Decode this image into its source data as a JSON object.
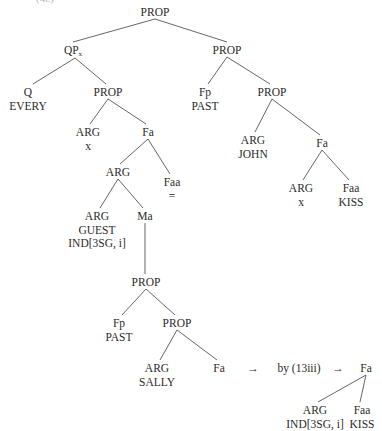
{
  "figure": {
    "top_fragment": "(4c)",
    "nodes": [
      {
        "id": "root",
        "lines": [
          "PROP"
        ],
        "x": 155,
        "y": 6
      },
      {
        "id": "qp",
        "lines": [
          "QP"
        ],
        "sub": "x",
        "x": 73,
        "y": 44
      },
      {
        "id": "prop_r",
        "lines": [
          "PROP"
        ],
        "x": 227,
        "y": 44
      },
      {
        "id": "q",
        "lines": [
          "Q",
          "EVERY"
        ],
        "x": 28,
        "y": 86
      },
      {
        "id": "prop_l",
        "lines": [
          "PROP"
        ],
        "x": 108,
        "y": 86
      },
      {
        "id": "fp_r",
        "lines": [
          "Fp",
          "PAST"
        ],
        "x": 205,
        "y": 86
      },
      {
        "id": "prop_r2",
        "lines": [
          "PROP"
        ],
        "x": 272,
        "y": 86
      },
      {
        "id": "arg_x",
        "lines": [
          "ARG",
          "x"
        ],
        "x": 88,
        "y": 126
      },
      {
        "id": "fa_l",
        "lines": [
          "Fa"
        ],
        "x": 148,
        "y": 126
      },
      {
        "id": "arg_john",
        "lines": [
          "ARG",
          "JOHN"
        ],
        "x": 253,
        "y": 134
      },
      {
        "id": "fa_r",
        "lines": [
          "Fa"
        ],
        "x": 322,
        "y": 137
      },
      {
        "id": "arg_mid",
        "lines": [
          "ARG"
        ],
        "x": 118,
        "y": 166
      },
      {
        "id": "faa_eq",
        "lines": [
          "Faa",
          "="
        ],
        "x": 172,
        "y": 176
      },
      {
        "id": "arg_x2",
        "lines": [
          "ARG",
          "x"
        ],
        "x": 301,
        "y": 182
      },
      {
        "id": "faa_kiss",
        "lines": [
          "Faa",
          "KISS"
        ],
        "x": 351,
        "y": 182
      },
      {
        "id": "arg_guest",
        "lines": [
          "ARG",
          "GUEST",
          "IND[3SG, i]"
        ],
        "x": 97,
        "y": 210
      },
      {
        "id": "ma",
        "lines": [
          "Ma"
        ],
        "x": 145,
        "y": 210
      },
      {
        "id": "prop_emb",
        "lines": [
          "PROP"
        ],
        "x": 146,
        "y": 276
      },
      {
        "id": "fp_emb",
        "lines": [
          "Fp",
          "PAST"
        ],
        "x": 119,
        "y": 317
      },
      {
        "id": "prop_emb2",
        "lines": [
          "PROP"
        ],
        "x": 177,
        "y": 317
      },
      {
        "id": "arg_sally",
        "lines": [
          "ARG",
          "SALLY"
        ],
        "x": 157,
        "y": 362
      },
      {
        "id": "fa_emb",
        "lines": [
          "Fa"
        ],
        "x": 219,
        "y": 362
      },
      {
        "id": "fa_out",
        "lines": [
          "Fa"
        ],
        "x": 366,
        "y": 362
      },
      {
        "id": "arg_ind",
        "lines": [
          "ARG",
          "IND[3SG, i]"
        ],
        "x": 315,
        "y": 404
      },
      {
        "id": "faa_kiss2",
        "lines": [
          "Faa",
          "KISS"
        ],
        "x": 362,
        "y": 404
      }
    ],
    "edges": [
      [
        155,
        19,
        73,
        42
      ],
      [
        155,
        19,
        227,
        42
      ],
      [
        75,
        58,
        33,
        84
      ],
      [
        75,
        58,
        106,
        84
      ],
      [
        227,
        57,
        208,
        84
      ],
      [
        227,
        57,
        270,
        84
      ],
      [
        108,
        99,
        90,
        124
      ],
      [
        108,
        99,
        146,
        124
      ],
      [
        272,
        99,
        255,
        132
      ],
      [
        272,
        99,
        320,
        135
      ],
      [
        148,
        139,
        120,
        164
      ],
      [
        148,
        139,
        170,
        174
      ],
      [
        322,
        150,
        303,
        180
      ],
      [
        322,
        150,
        349,
        180
      ],
      [
        118,
        179,
        100,
        208
      ],
      [
        118,
        179,
        143,
        208
      ],
      [
        145,
        223,
        145,
        274
      ],
      [
        146,
        289,
        122,
        315
      ],
      [
        146,
        289,
        175,
        315
      ],
      [
        177,
        330,
        160,
        360
      ],
      [
        177,
        330,
        217,
        360
      ],
      [
        366,
        375,
        318,
        402
      ],
      [
        366,
        375,
        360,
        402
      ]
    ],
    "derivation": [
      {
        "text": "→",
        "x": 253,
        "y": 362
      },
      {
        "text": "by (13iii)",
        "x": 299,
        "y": 362
      },
      {
        "text": "→",
        "x": 338,
        "y": 362
      }
    ]
  }
}
